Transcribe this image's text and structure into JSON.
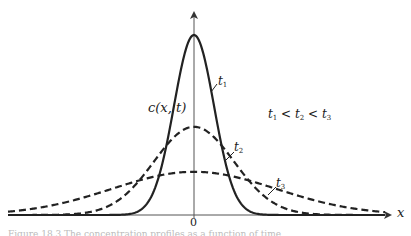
{
  "chart_data": {
    "type": "line",
    "title": "",
    "xlabel": "x",
    "ylabel": "c(x, t)",
    "x_ticks": [
      "0"
    ],
    "grid": false,
    "legend": "inline labels on curves",
    "annotation": "t1 < t2 < t3",
    "series": [
      {
        "name": "t1",
        "style": "solid",
        "peak": 1.0,
        "width": "narrow"
      },
      {
        "name": "t2",
        "style": "dashed",
        "peak": 0.49,
        "width": "medium"
      },
      {
        "name": "t3",
        "style": "dashed",
        "peak": 0.24,
        "width": "wide"
      }
    ]
  },
  "labels": {
    "y_axis": "c(x, t)",
    "x_axis": "x",
    "origin": "0",
    "t1": "t",
    "t1_sub": "1",
    "t2": "t",
    "t2_sub": "2",
    "t3": "t",
    "t3_sub": "3",
    "ordering_a": "t",
    "ordering_a_sub": "1",
    "ordering_lt1": " < ",
    "ordering_b": "t",
    "ordering_b_sub": "2",
    "ordering_lt2": " < ",
    "ordering_c": "t",
    "ordering_c_sub": "3"
  },
  "caption": "Figure 18.3  The concentration profiles as a function of time"
}
